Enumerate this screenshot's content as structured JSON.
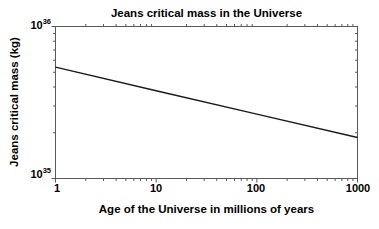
{
  "figure": {
    "background": "#ffffff",
    "text_color": "#000000"
  },
  "chart_data": {
    "type": "line",
    "title": "Jeans critical mass in the Universe",
    "xlabel": "Age of the Universe in millions of years",
    "ylabel": "Jeans critical mass (kg)",
    "x_scale": "log",
    "y_scale": "log",
    "xlim": [
      1,
      1000
    ],
    "ylim": [
      1e+35,
      1e+36
    ],
    "grid": false,
    "legend": false,
    "axis_color": "#595959",
    "x_ticks": [
      {
        "value": 1,
        "label": "1"
      },
      {
        "value": 10,
        "label": "10"
      },
      {
        "value": 100,
        "label": "100"
      },
      {
        "value": 1000,
        "label": "1000"
      }
    ],
    "y_ticks": [
      {
        "value": 1e+35,
        "base": "10",
        "exp": "35"
      },
      {
        "value": 1e+36,
        "base": "10",
        "exp": "36"
      }
    ],
    "series": [
      {
        "name": "Jeans critical mass",
        "color": "#1a1a1a",
        "x": [
          1,
          10,
          100,
          1000
        ],
        "y": [
          5.4e+35,
          3.78e+35,
          2.65e+35,
          1.86e+35
        ]
      }
    ]
  }
}
